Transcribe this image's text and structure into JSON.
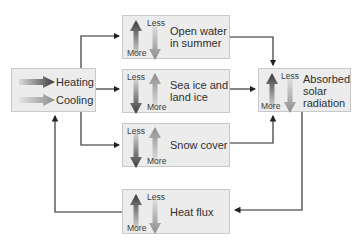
{
  "diagram": {
    "legend": {
      "heating_label": "Heating",
      "cooling_label": "Cooling"
    },
    "boxes": [
      {
        "id": "open-water",
        "title_lines": [
          "Open water",
          "in summer"
        ],
        "up_label": "More",
        "down_label": "Less",
        "dark_arrow": "up"
      },
      {
        "id": "sea-ice",
        "title_lines": [
          "Sea ice and",
          "land ice"
        ],
        "up_label": "More",
        "down_label": "Less",
        "dark_arrow": "down"
      },
      {
        "id": "snow-cover",
        "title_lines": [
          "Snow cover"
        ],
        "up_label": "More",
        "down_label": "Less",
        "dark_arrow": "down"
      },
      {
        "id": "absorbed-solar",
        "title_lines": [
          "Absorbed",
          "solar",
          "radiation"
        ],
        "up_label": "More",
        "down_label": "Less",
        "dark_arrow": "up"
      },
      {
        "id": "heat-flux",
        "title_lines": [
          "Heat flux"
        ],
        "up_label": "More",
        "down_label": "Less",
        "dark_arrow": "up"
      }
    ],
    "colors": {
      "heating_arrow": "#3a3a3a",
      "cooling_arrow": "#8c8c8c",
      "box_fill": "#ececec",
      "box_border": "#c9c9c9",
      "connector": "#222222"
    }
  }
}
